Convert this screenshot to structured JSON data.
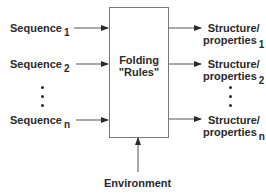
{
  "diagram": {
    "inputs": [
      {
        "label": "Sequence",
        "subscript": "1"
      },
      {
        "label": "Sequence",
        "subscript": "2"
      },
      {
        "label": "Sequence",
        "subscript": "n"
      }
    ],
    "process": {
      "line1": "Folding",
      "line2": "\"Rules\""
    },
    "outputs": [
      {
        "line1": "Structure/",
        "line2": "properties",
        "subscript": "1"
      },
      {
        "line1": "Structure/",
        "line2": "properties",
        "subscript": "2"
      },
      {
        "line1": "Structure/",
        "line2": "properties",
        "subscript": "n"
      }
    ],
    "environment": "Environment",
    "line_color": "#555555",
    "text_color": "#2a2a2a"
  }
}
